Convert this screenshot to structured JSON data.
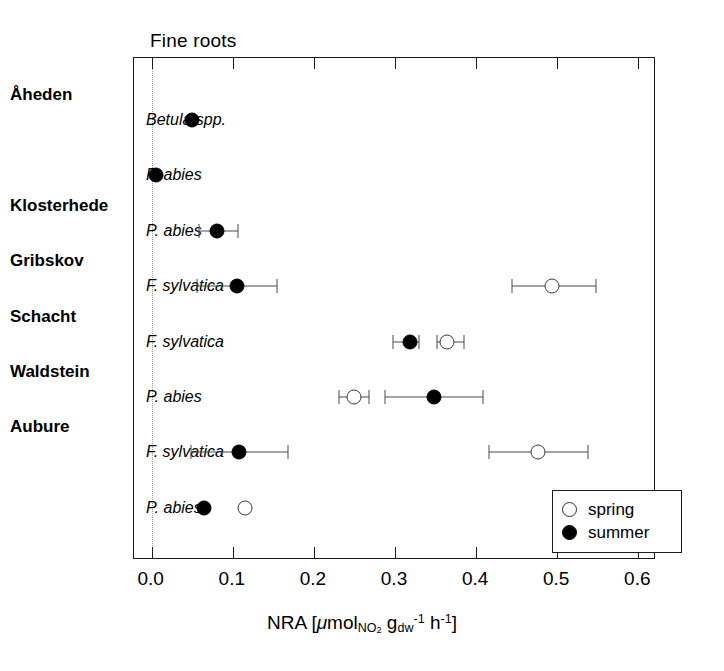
{
  "panel": {
    "title": "Fine roots"
  },
  "axis": {
    "title_prefix": "NRA [",
    "mu": "μ",
    "mol": "mol",
    "sub_no2": "NO",
    "sub_no2_num": "2",
    "g": " g",
    "sub_dw": "dw",
    "sup_neg1_a": "-1",
    "h": " h",
    "sup_neg1_b": "-1",
    "title_suffix": "]",
    "tick_labels": [
      "0.0",
      "0.1",
      "0.2",
      "0.3",
      "0.4",
      "0.5",
      "0.6"
    ],
    "xmin": -0.0218,
    "xmax": 0.6218
  },
  "sites": [
    {
      "name": "Åheden"
    },
    {
      "name": "Klosterhede"
    },
    {
      "name": "Gribskov"
    },
    {
      "name": "Schacht"
    },
    {
      "name": "Waldstein"
    },
    {
      "name": "Aubure"
    }
  ],
  "legend": {
    "items": [
      {
        "key": "spring",
        "label": "spring"
      },
      {
        "key": "summer",
        "label": "summer"
      }
    ]
  },
  "colors": {
    "summer": "#000000",
    "spring": "#ffffff",
    "frame": "#1a1a1a",
    "errorbar": "#4a4a4a",
    "zero_line": "#9a9a9a"
  },
  "chart_data": {
    "type": "scatter",
    "title": "Fine roots",
    "xlabel": "NRA [μmol_NO2 g_dw^-1 h^-1]",
    "ylabel": "",
    "xlim": [
      -0.0218,
      0.6218
    ],
    "xticks": [
      0.0,
      0.1,
      0.2,
      0.3,
      0.4,
      0.5,
      0.6
    ],
    "grid": false,
    "legend_position": "bottom-right",
    "series": [
      {
        "name": "spring",
        "marker": "open-circle"
      },
      {
        "name": "summer",
        "marker": "filled-circle"
      }
    ],
    "rows": [
      {
        "site": "Åheden",
        "species": "Betula spp.",
        "summer": {
          "value": 0.05,
          "err_low": null,
          "err_high": null
        },
        "spring": null
      },
      {
        "site": "Åheden",
        "species": "P. abies",
        "summer": {
          "value": 0.005,
          "err_low": null,
          "err_high": null
        },
        "spring": null
      },
      {
        "site": "Klosterhede",
        "species": "P. abies",
        "summer": {
          "value": 0.08,
          "err_low": 0.058,
          "err_high": 0.107
        },
        "spring": null
      },
      {
        "site": "Gribskov",
        "species": "F. sylvatica",
        "summer": {
          "value": 0.105,
          "err_low": 0.056,
          "err_high": 0.155
        },
        "spring": {
          "value": 0.494,
          "err_low": 0.444,
          "err_high": 0.548
        }
      },
      {
        "site": "Schacht",
        "species": "F. sylvatica",
        "summer": {
          "value": 0.318,
          "err_low": 0.298,
          "err_high": 0.33
        },
        "spring": {
          "value": 0.364,
          "err_low": 0.352,
          "err_high": 0.385
        }
      },
      {
        "site": "Waldstein",
        "species": "P. abies",
        "summer": {
          "value": 0.348,
          "err_low": 0.288,
          "err_high": 0.408
        },
        "spring": {
          "value": 0.249,
          "err_low": 0.231,
          "err_high": 0.268
        }
      },
      {
        "site": "Aubure",
        "species": "F. sylvatica",
        "summer": {
          "value": 0.108,
          "err_low": 0.048,
          "err_high": 0.168
        },
        "spring": {
          "value": 0.476,
          "err_low": 0.416,
          "err_high": 0.538
        }
      },
      {
        "site": "Aubure",
        "species": "P. abies",
        "summer": {
          "value": 0.065,
          "err_low": null,
          "err_high": null
        },
        "spring": {
          "value": 0.115,
          "err_low": null,
          "err_high": null
        }
      }
    ],
    "row_site_anchor": [
      {
        "site": "Åheden",
        "row_index": 0
      },
      {
        "site": "Klosterhede",
        "row_index": 2
      },
      {
        "site": "Gribskov",
        "row_index": 3
      },
      {
        "site": "Schacht",
        "row_index": 4
      },
      {
        "site": "Waldstein",
        "row_index": 5
      },
      {
        "site": "Aubure",
        "row_index": 6
      }
    ]
  }
}
